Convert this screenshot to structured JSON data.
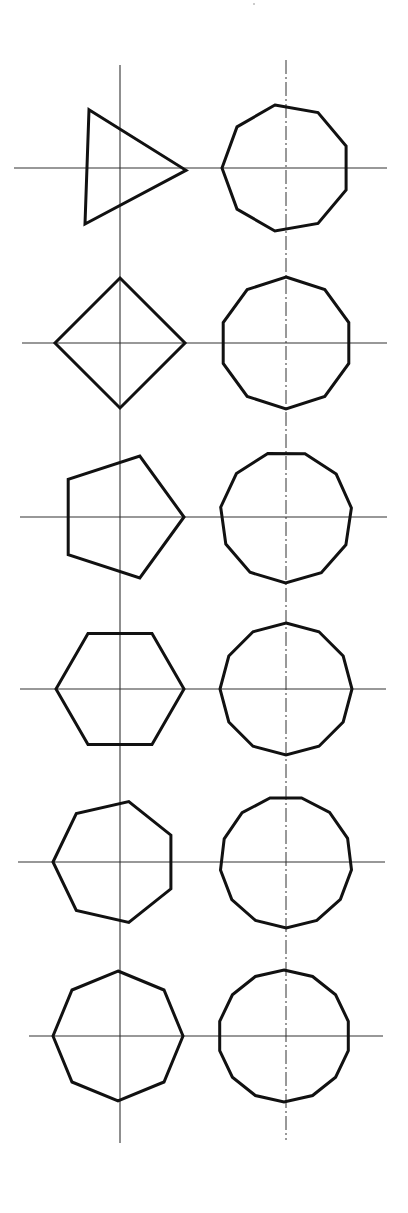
{
  "figure": {
    "stroke_color": "#111111",
    "axis_color": "#333333",
    "background": "#ffffff",
    "columns": [
      {
        "name": "left",
        "axis_x": 120,
        "axis_top": 65,
        "axis_bottom": 1143
      },
      {
        "name": "right",
        "axis_x": 286,
        "axis_top": 60,
        "axis_bottom": 1140
      }
    ],
    "rows": [
      {
        "cy": 168,
        "h_from": 14,
        "h_to": 387
      },
      {
        "cy": 343,
        "h_from": 22,
        "h_to": 387
      },
      {
        "cy": 517,
        "h_from": 20,
        "h_to": 387
      },
      {
        "cy": 689,
        "h_from": 20,
        "h_to": 386
      },
      {
        "cy": 862,
        "h_from": 18,
        "h_to": 385
      },
      {
        "cy": 1036,
        "h_from": 29,
        "h_to": 383
      }
    ],
    "shapes": [
      {
        "sides": 3,
        "col": "left",
        "row": 0,
        "cx": 120,
        "cy": 168,
        "r": 66,
        "rotation": -118
      },
      {
        "sides": 9,
        "col": "right",
        "row": 0,
        "cx": 286,
        "cy": 168,
        "r": 64,
        "rotation": -100
      },
      {
        "sides": 4,
        "col": "left",
        "row": 1,
        "cx": 120,
        "cy": 343,
        "r": 65,
        "rotation": -90
      },
      {
        "sides": 10,
        "col": "right",
        "row": 1,
        "cx": 286,
        "cy": 343,
        "r": 66,
        "rotation": -90
      },
      {
        "sides": 5,
        "col": "left",
        "row": 2,
        "cx": 120,
        "cy": 517,
        "r": 64,
        "rotation": 0
      },
      {
        "sides": 11,
        "col": "right",
        "row": 2,
        "cx": 286,
        "cy": 517,
        "r": 66,
        "rotation": -106
      },
      {
        "sides": 6,
        "col": "left",
        "row": 3,
        "cx": 120,
        "cy": 689,
        "r": 64,
        "rotation": 0
      },
      {
        "sides": 12,
        "col": "right",
        "row": 3,
        "cx": 286,
        "cy": 689,
        "r": 66,
        "rotation": -90
      },
      {
        "sides": 7,
        "col": "left",
        "row": 4,
        "cx": 115,
        "cy": 862,
        "r": 62,
        "rotation": 180
      },
      {
        "sides": 13,
        "col": "right",
        "row": 4,
        "cx": 286,
        "cy": 862,
        "r": 66,
        "rotation": -104
      },
      {
        "sides": 8,
        "col": "left",
        "row": 5,
        "cx": 118,
        "cy": 1036,
        "r": 65,
        "rotation": -90
      },
      {
        "sides": 14,
        "col": "right",
        "row": 5,
        "cx": 284,
        "cy": 1036,
        "r": 66,
        "rotation": -90
      }
    ],
    "labels": []
  }
}
